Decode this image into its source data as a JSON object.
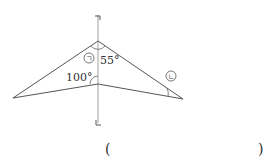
{
  "diagram": {
    "type": "geometry",
    "shape": "concave quadrilateral (dart) bisected by a vertical line",
    "line_labels": {
      "top": "ㄱ",
      "bottom": "ㄴ"
    },
    "angle_labels": {
      "top_right": "55°",
      "inner_left": "100°",
      "marker_a": "ㄱ",
      "marker_b": "ㄴ"
    },
    "points": {
      "top_apex": [
        98,
        41
      ],
      "left_vertex": [
        13,
        98
      ],
      "inner_vertex": [
        98,
        84
      ],
      "right_vertex": [
        183,
        99
      ]
    },
    "line_color": "#555555"
  },
  "answer": {
    "open_paren": "(",
    "close_paren": ")",
    "value": ""
  }
}
